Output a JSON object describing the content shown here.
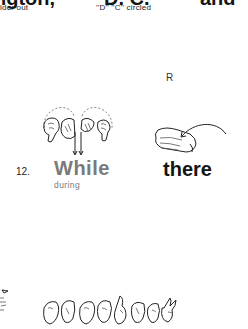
{
  "top_row": {
    "headings": [
      "ngton,",
      "D. C.",
      "and"
    ],
    "subtitles": [
      "lder out",
      "''D'' ''C'' circled"
    ]
  },
  "section_letter": "R",
  "entries": [
    {
      "number": "12.",
      "word": "While",
      "gloss": "during",
      "illustration": "two-hands-circle-down-sign"
    },
    {
      "word": "there",
      "illustration": "pointing-hand-arc-sign"
    }
  ],
  "bottom_row": {
    "illustration": "fingerspelling-hands-sequence",
    "hand_count": 8
  }
}
